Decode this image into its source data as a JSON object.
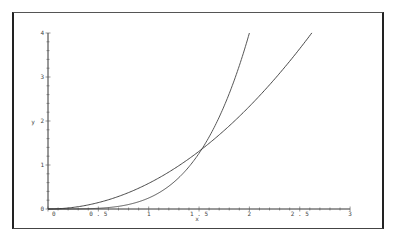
{
  "chart_data": {
    "type": "line",
    "title": "",
    "xlabel": "x",
    "ylabel": "y",
    "xlim": [
      0,
      3
    ],
    "ylim": [
      0,
      4
    ],
    "grid": false,
    "legend": null,
    "x_ticks": [
      "0",
      "0.5",
      "1",
      "1.5",
      "2",
      "2.5",
      "3"
    ],
    "y_ticks": [
      "0",
      "1",
      "2",
      "3",
      "4"
    ],
    "series": [
      {
        "name": "curve-a",
        "style": "solid (lighter/dotted near origin)",
        "x": [
          0,
          0.25,
          0.5,
          0.75,
          1.0,
          1.25,
          1.5,
          1.75,
          2.0
        ],
        "y": [
          0,
          0.001,
          0.016,
          0.079,
          0.25,
          0.61,
          1.27,
          2.35,
          4.0
        ]
      },
      {
        "name": "curve-b",
        "style": "solid",
        "x": [
          0,
          0.25,
          0.5,
          0.75,
          1.0,
          1.25,
          1.5,
          1.75,
          2.0,
          2.25,
          2.5,
          2.62
        ],
        "y": [
          0,
          0.036,
          0.146,
          0.328,
          0.583,
          0.911,
          1.31,
          1.79,
          2.33,
          2.95,
          3.64,
          4.0
        ]
      }
    ],
    "annotations": [
      {
        "text": "intersection",
        "x": 1.53,
        "y": 1.36
      }
    ]
  },
  "axes": {
    "xlabel": "x",
    "ylabel": "y",
    "x_tick_labels": [
      "0",
      "0.5",
      "1",
      "1.5",
      "2",
      "2.5",
      "3"
    ],
    "y_tick_labels": [
      "0",
      "1",
      "2",
      "3",
      "4"
    ]
  }
}
